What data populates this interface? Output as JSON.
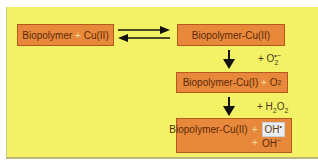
{
  "diagram": {
    "background_color": "#f3f266",
    "box_color": "#e8883a",
    "nodes": [
      {
        "id": "reactants",
        "parts": [
          "Biopolymer",
          "+",
          "Cu(II)"
        ]
      },
      {
        "id": "complex",
        "text": "Biopolymer-Cu(II)"
      },
      {
        "id": "reduced",
        "parts": [
          "Biopolymer-Cu(I)",
          "+",
          "O",
          "2"
        ]
      },
      {
        "id": "product",
        "parts": [
          "Biopolymer-Cu(II)",
          "+",
          "OH",
          "•",
          "+",
          "OH",
          "−"
        ]
      }
    ],
    "edges": [
      {
        "from": "reactants",
        "to": "complex",
        "type": "equilibrium"
      },
      {
        "from": "complex",
        "to": "reduced",
        "type": "arrow",
        "reagent": {
          "prefix": "+ O",
          "sub": "2",
          "sup": "•−"
        }
      },
      {
        "from": "reduced",
        "to": "product",
        "type": "arrow",
        "reagent": {
          "prefix": "+ H",
          "sub1": "2",
          "mid": "O",
          "sub2": "2"
        }
      }
    ]
  }
}
